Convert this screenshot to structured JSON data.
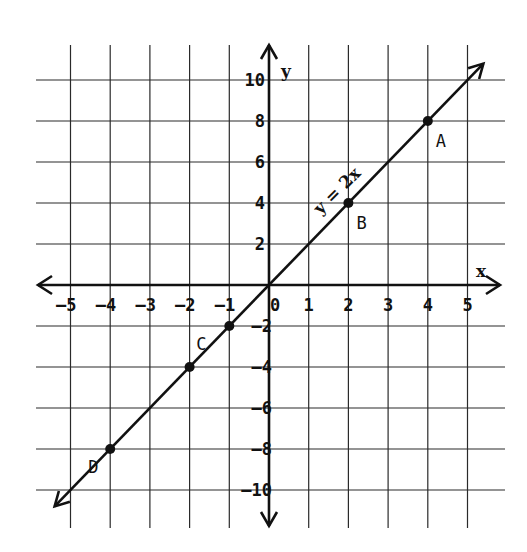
{
  "chart_data": {
    "type": "line",
    "title": "",
    "equation_label": "y = 2x",
    "xlabel": "x",
    "ylabel": "y",
    "xlim": [
      -5.8,
      5.8
    ],
    "ylim": [
      -11.5,
      11.5
    ],
    "grid": true,
    "x_ticks": [
      -5,
      -4,
      -3,
      -2,
      -1,
      0,
      1,
      2,
      3,
      4,
      5
    ],
    "x_tick_labels": [
      "-5",
      "-4",
      "-3",
      "-2",
      "-1",
      "0",
      "1",
      "2",
      "3",
      "4",
      "5"
    ],
    "y_ticks": [
      10,
      8,
      6,
      4,
      2,
      -2,
      -4,
      -6,
      -8,
      -10
    ],
    "y_tick_labels": [
      "10",
      "8",
      "6",
      "4",
      "2",
      "-2",
      "-4",
      "-6",
      "-8",
      "-10"
    ],
    "series": [
      {
        "name": "y = 2x",
        "slope": 2,
        "intercept": 0,
        "x": [
          -5.4,
          5.4
        ],
        "y": [
          -10.8,
          10.8
        ]
      }
    ],
    "points": [
      {
        "label": "A",
        "x": 4,
        "y": 8
      },
      {
        "label": "B",
        "x": 2,
        "y": 4
      },
      {
        "label": "C",
        "x": -1,
        "y": -2
      },
      {
        "label": "",
        "x": -2,
        "y": -4
      },
      {
        "label": "D",
        "x": -4,
        "y": -8
      }
    ]
  }
}
